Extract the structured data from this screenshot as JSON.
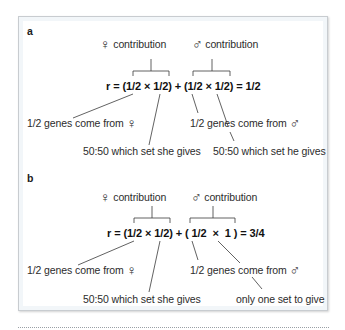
{
  "panels": {
    "a": {
      "label": "a",
      "female_contribution": {
        "symbol": "♀",
        "text": "contribution"
      },
      "male_contribution": {
        "symbol": "♂",
        "text": "contribution"
      },
      "equation": "r = (1/2 × 1/2) + (1/2 × 1/2) = 1/2",
      "annotations": {
        "female_genes": {
          "text": "1/2 genes come from",
          "symbol": "♀"
        },
        "female_set": "50:50 which set she gives",
        "male_genes": {
          "text": "1/2 genes come from",
          "symbol": "♂"
        },
        "male_set": "50:50 which set he gives"
      }
    },
    "b": {
      "label": "b",
      "female_contribution": {
        "symbol": "♀",
        "text": "contribution"
      },
      "male_contribution": {
        "symbol": "♂",
        "text": "contribution"
      },
      "equation": "r = (1/2 × 1/2) + ( 1/2  ×  1 ) = 3/4",
      "annotations": {
        "female_genes": {
          "text": "1/2 genes come from",
          "symbol": "♀"
        },
        "female_set": "50:50 which set she gives",
        "male_genes": {
          "text": "1/2 genes come from",
          "symbol": "♂"
        },
        "male_set": "only one set to give"
      }
    }
  },
  "colors": {
    "line": "#3a3a3a",
    "box_border": "#c8ccd0",
    "text": "#2c2c2c"
  }
}
